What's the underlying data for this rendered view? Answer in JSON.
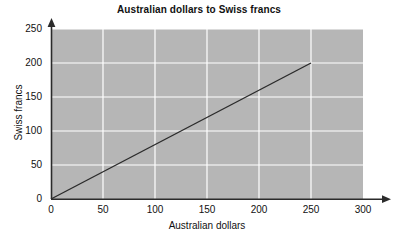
{
  "chart_data": {
    "type": "line",
    "title": "Australian dollars to Swiss francs",
    "xlabel": "Australian dollars",
    "ylabel": "Swiss francs",
    "xlim": [
      0,
      300
    ],
    "ylim": [
      0,
      250
    ],
    "xticks": [
      0,
      50,
      100,
      150,
      200,
      250,
      300
    ],
    "yticks": [
      0,
      50,
      100,
      150,
      200,
      250
    ],
    "xtick_labels": [
      "0",
      "50",
      "100",
      "150",
      "200",
      "250",
      "300"
    ],
    "ytick_labels": [
      "0",
      "50",
      "100",
      "150",
      "200",
      "250"
    ],
    "grid": true,
    "grid_color": "#ffffff",
    "plot_background": "#b6b6b6",
    "page_background": "#ffffff",
    "legend": null,
    "axis_arrows": true,
    "series": [
      {
        "name": "conversion",
        "color": "#2b2b2b",
        "points": [
          {
            "x": 0,
            "y": 0
          },
          {
            "x": 250,
            "y": 200
          }
        ]
      }
    ]
  }
}
